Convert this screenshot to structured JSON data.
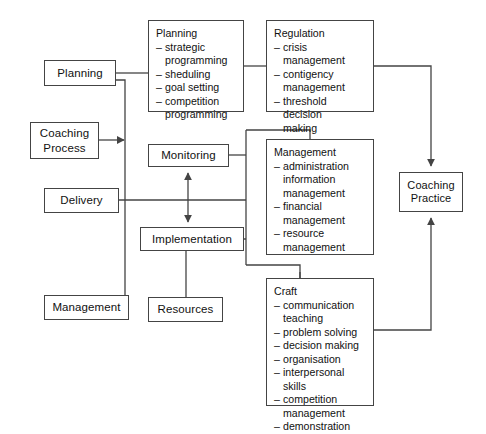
{
  "diagram": {
    "background_color": "#ffffff",
    "line_color": "#444444",
    "nodes": {
      "planning": {
        "label": "Planning"
      },
      "coaching_process": {
        "label": "Coaching\nProcess"
      },
      "delivery": {
        "label": "Delivery"
      },
      "management_left": {
        "label": "Management"
      },
      "monitoring": {
        "label": "Monitoring"
      },
      "implementation": {
        "label": "Implementation"
      },
      "resources": {
        "label": "Resources"
      },
      "coaching_practice": {
        "label": "Coaching\nPractice"
      },
      "planning_detail": {
        "heading": "Planning",
        "items": [
          "strategic\nprogramming",
          "sheduling",
          "goal setting",
          "competition\nprogramming"
        ]
      },
      "regulation": {
        "heading": "Regulation",
        "items": [
          "crisis management",
          "contigency\nmanagement",
          "threshold decision\nmaking"
        ]
      },
      "management": {
        "heading": "Management",
        "items": [
          "administration\ninformation\nmanagement",
          "financial\nmanagement",
          "resource\nmanagement"
        ]
      },
      "craft": {
        "heading": "Craft",
        "items": [
          "communication\nteaching",
          "problem solving",
          "decision making",
          "organisation",
          "interpersonal skills",
          "competition\nmanagement",
          "demonstration"
        ]
      }
    }
  }
}
